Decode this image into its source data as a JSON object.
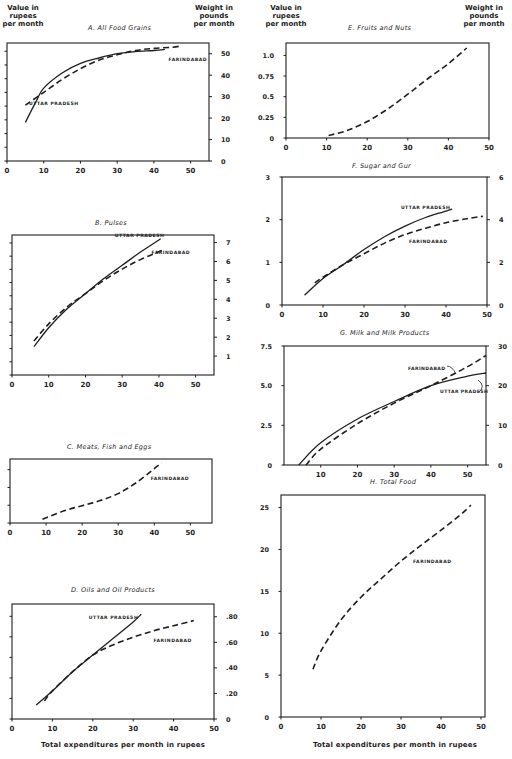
{
  "header": {
    "left_axis_label": "Value in rupees per month",
    "left_axis_label_lines": [
      "Value in",
      "rupees",
      "per month"
    ],
    "right_axis_label": "Weight in pounds per month",
    "right_axis_label_lines": [
      "Weight in",
      "pounds",
      "per month"
    ],
    "x_axis_label": "Total expenditures per month in rupees"
  },
  "legend": {
    "uttar_pradesh": "UTTAR PRADESH",
    "farindabad": "FARINDABAD",
    "uttar_style": "solid",
    "farindabad_style": "dashed"
  },
  "chart_data": [
    {
      "id": "A",
      "type": "line",
      "title": "A. All Food Grains",
      "xlabel": "",
      "ylabel": "Value in rupees per month",
      "y2label": "Weight in pounds per month",
      "xlim": [
        0,
        55
      ],
      "xticks": [
        0,
        10,
        20,
        30,
        40,
        50
      ],
      "y2lim": [
        0,
        55
      ],
      "y2ticks": [
        0,
        10,
        20,
        30,
        40,
        50
      ],
      "series": [
        {
          "name": "UTTAR PRADESH",
          "style": "solid",
          "x": [
            5,
            8,
            10,
            15,
            20,
            25,
            30,
            35,
            40,
            43
          ],
          "y": [
            18,
            28,
            34,
            41,
            45.5,
            48,
            50,
            51,
            51.5,
            52
          ]
        },
        {
          "name": "FARINDABAD",
          "style": "dashed",
          "x": [
            5,
            10,
            15,
            20,
            25,
            30,
            35,
            40,
            45,
            47
          ],
          "y": [
            26,
            32,
            38,
            43,
            47,
            49.5,
            51.5,
            52.5,
            53,
            53.5
          ]
        }
      ],
      "grid": false
    },
    {
      "id": "B",
      "type": "line",
      "title": "B. Pulses",
      "xlabel": "",
      "ylabel": "Value in rupees per month",
      "y2label": "Weight in pounds per month",
      "xlim": [
        0,
        55
      ],
      "xticks": [
        0,
        10,
        20,
        30,
        40,
        50
      ],
      "y2lim": [
        0,
        7.4
      ],
      "y2ticks": [
        1,
        2,
        3,
        4,
        5,
        6,
        7
      ],
      "series": [
        {
          "name": "UTTAR PRADESH",
          "style": "solid",
          "x": [
            6,
            10,
            15,
            20,
            25,
            30,
            35,
            40.5
          ],
          "y": [
            1.5,
            2.5,
            3.5,
            4.3,
            5.1,
            5.8,
            6.5,
            7.2
          ]
        },
        {
          "name": "FARINDABAD",
          "style": "dashed",
          "x": [
            6,
            10,
            15,
            20,
            25,
            30,
            35,
            41
          ],
          "y": [
            1.8,
            2.7,
            3.6,
            4.3,
            5.0,
            5.6,
            6.1,
            6.6
          ]
        }
      ],
      "grid": false
    },
    {
      "id": "C",
      "type": "line",
      "title": "C. Meats, Fish and Eggs",
      "xlabel": "",
      "ylabel": "Value in rupees per month",
      "xlim": [
        0,
        56
      ],
      "xticks": [
        0,
        10,
        20,
        30,
        40,
        50
      ],
      "ylim": [
        0,
        1.0
      ],
      "series": [
        {
          "name": "FARINDABAD",
          "style": "dashed",
          "x": [
            9,
            15,
            20,
            25,
            30,
            35,
            40,
            42
          ],
          "y": [
            0.06,
            0.19,
            0.27,
            0.35,
            0.46,
            0.63,
            0.85,
            0.94
          ]
        }
      ],
      "grid": false
    },
    {
      "id": "D",
      "type": "line",
      "title": "D. Oils and Oil Products",
      "xlabel": "Total expenditures per month in rupees",
      "ylabel": "Value in rupees per month",
      "y2label": "Weight in pounds per month",
      "xlim": [
        0,
        50
      ],
      "xticks": [
        0,
        10,
        20,
        30,
        40,
        50
      ],
      "y2lim": [
        0,
        0.9
      ],
      "y2ticks": [
        0,
        0.2,
        0.4,
        0.6,
        0.8
      ],
      "y2ticklabels": [
        "0",
        ".20",
        ".40",
        ".60",
        ".80"
      ],
      "series": [
        {
          "name": "UTTAR PRADESH",
          "style": "solid",
          "x": [
            6,
            10,
            15,
            20,
            25,
            30,
            32
          ],
          "y": [
            0.11,
            0.22,
            0.37,
            0.5,
            0.63,
            0.76,
            0.82
          ]
        },
        {
          "name": "FARINDABAD",
          "style": "dashed",
          "x": [
            8,
            10,
            15,
            20,
            25,
            30,
            35,
            40,
            45
          ],
          "y": [
            0.14,
            0.22,
            0.37,
            0.5,
            0.58,
            0.64,
            0.69,
            0.73,
            0.77
          ]
        }
      ],
      "grid": false
    },
    {
      "id": "E",
      "type": "line",
      "title": "E. Fruits and Nuts",
      "xlabel": "",
      "ylabel": "Value in rupees per month",
      "y2label": "Weight in pounds per month",
      "xlim": [
        0,
        50
      ],
      "xticks": [
        0,
        10,
        20,
        30,
        40,
        50
      ],
      "ylim": [
        0,
        1.15
      ],
      "yticks": [
        0,
        0.25,
        0.5,
        0.75,
        1.0
      ],
      "yticklabels": [
        "0",
        "0.25",
        "0.5",
        "0.75",
        "1.0"
      ],
      "series": [
        {
          "name": "FARINDABAD",
          "style": "dashed",
          "x": [
            10.5,
            15,
            20,
            25,
            30,
            35,
            40,
            44.5
          ],
          "y": [
            0.03,
            0.09,
            0.2,
            0.35,
            0.53,
            0.72,
            0.9,
            1.09
          ]
        }
      ],
      "grid": false
    },
    {
      "id": "F",
      "type": "line",
      "title": "F. Sugar and Gur",
      "xlabel": "",
      "ylabel": "Value in rupees per month",
      "y2label": "Weight in pounds per month",
      "xlim": [
        0,
        50
      ],
      "xticks": [
        0,
        10,
        20,
        30,
        40,
        50
      ],
      "ylim": [
        0,
        3
      ],
      "yticks": [
        0,
        1,
        2,
        3
      ],
      "y2lim": [
        0,
        6
      ],
      "y2ticks": [
        0,
        2,
        4,
        6
      ],
      "series": [
        {
          "name": "UTTAR PRADESH",
          "style": "solid",
          "x": [
            5.5,
            10,
            15,
            20,
            25,
            30,
            35,
            40,
            41.5
          ],
          "y": [
            0.23,
            0.62,
            0.95,
            1.3,
            1.6,
            1.85,
            2.05,
            2.2,
            2.25
          ]
        },
        {
          "name": "FARINDABAD",
          "style": "dashed",
          "x": [
            8,
            10,
            15,
            20,
            25,
            30,
            35,
            40,
            45,
            49
          ],
          "y": [
            0.52,
            0.65,
            0.95,
            1.2,
            1.45,
            1.65,
            1.8,
            1.93,
            2.02,
            2.08
          ]
        }
      ],
      "grid": false
    },
    {
      "id": "G",
      "type": "line",
      "title": "G. Milk and Milk Products",
      "xlabel": "",
      "ylabel": "Value in rupees per month",
      "y2label": "Weight in pounds per month",
      "xlim": [
        0,
        55
      ],
      "xticks": [
        10,
        20,
        30,
        40,
        50
      ],
      "ylim": [
        0,
        7.5
      ],
      "yticks": [
        0,
        2.5,
        5.0,
        7.5
      ],
      "yticklabels": [
        "0",
        "2.5",
        "5.0",
        "7.5"
      ],
      "y2lim": [
        0,
        30
      ],
      "y2ticks": [
        0,
        10,
        20,
        30
      ],
      "series": [
        {
          "name": "UTTAR PRADESH",
          "style": "solid",
          "x": [
            4,
            10,
            20,
            30,
            40,
            50,
            55
          ],
          "y": [
            0,
            1.4,
            2.9,
            4.0,
            5.0,
            5.6,
            5.8
          ]
        },
        {
          "name": "FARINDABAD",
          "style": "dashed",
          "x": [
            6,
            10,
            20,
            30,
            40,
            50,
            55
          ],
          "y": [
            0,
            1.0,
            2.6,
            3.9,
            5.0,
            6.2,
            6.9
          ]
        }
      ],
      "grid": false
    },
    {
      "id": "H",
      "type": "line",
      "title": "H. Total Food",
      "xlabel": "Total expenditures per month in rupees",
      "ylabel": "Value in rupees per month",
      "xlim": [
        0,
        51
      ],
      "xticks": [
        0,
        10,
        20,
        30,
        40,
        50
      ],
      "ylim": [
        0,
        26.5
      ],
      "yticks": [
        0,
        5,
        10,
        15,
        20,
        25
      ],
      "series": [
        {
          "name": "FARINDABAD",
          "style": "dashed",
          "x": [
            8,
            10,
            15,
            20,
            25,
            30,
            35,
            40,
            45,
            47.5
          ],
          "y": [
            5.7,
            7.9,
            11.6,
            14.3,
            16.5,
            18.6,
            20.5,
            22.3,
            24.2,
            25.3
          ]
        }
      ],
      "grid": false
    }
  ],
  "panels_layout": {
    "A": {
      "x0": 7,
      "x1": 209,
      "y0": 43,
      "y1": 161,
      "label_up": [
        6,
        27
      ],
      "label_fa": [
        44,
        47.5
      ],
      "left_ticks": 8
    },
    "B": {
      "x0": 12,
      "x1": 214,
      "y0": 235,
      "y1": 375,
      "label_up": [
        28,
        7.4
      ],
      "label_fa": [
        38,
        6.5
      ],
      "left_ticks": 10
    },
    "C": {
      "x0": 10,
      "x1": 212,
      "y0": 459,
      "y1": 523,
      "label_fa": [
        39,
        0.7
      ],
      "left_ticks": 3
    },
    "D": {
      "x0": 12,
      "x1": 214,
      "y0": 604,
      "y1": 719,
      "label_up": [
        19,
        0.8
      ],
      "label_fa": [
        35,
        0.62
      ],
      "left_ticks": 5
    },
    "E": {
      "x0": 286,
      "x1": 489,
      "y0": 43,
      "y1": 138
    },
    "F": {
      "x0": 282,
      "x1": 487,
      "y0": 177,
      "y1": 305,
      "label_up": [
        29,
        2.3
      ],
      "label_fa": [
        31,
        1.5
      ]
    },
    "G": {
      "x0": 284,
      "x1": 486,
      "y0": 346,
      "y1": 465
    },
    "H": {
      "x0": 281,
      "x1": 485,
      "y0": 495,
      "y1": 717,
      "label_fa": [
        33,
        18.6
      ]
    }
  }
}
